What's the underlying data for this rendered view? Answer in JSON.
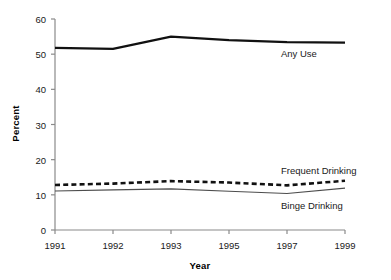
{
  "chart_data": {
    "type": "line",
    "title": "",
    "xlabel": "Year",
    "ylabel": "Percent",
    "x": [
      "1991",
      "1992",
      "1993",
      "1995",
      "1997",
      "1999"
    ],
    "categories": [
      "1991",
      "1992",
      "1993",
      "1995",
      "1997",
      "1999"
    ],
    "xtick_labels": [
      "1991",
      "1992",
      "1993",
      "1995",
      "1997",
      "1999"
    ],
    "ytick_labels": [
      "0",
      "10",
      "20",
      "30",
      "40",
      "50",
      "60"
    ],
    "ytick_values": [
      0,
      10,
      20,
      30,
      40,
      50,
      60
    ],
    "ylim": [
      0,
      60
    ],
    "grid": false,
    "legend_position": "inline-labels",
    "series": [
      {
        "name": "Any Use",
        "label": "Any Use",
        "style": "solid-thick",
        "color": "#111111",
        "values": [
          51.8,
          51.5,
          55.0,
          54.0,
          53.4,
          53.3
        ]
      },
      {
        "name": "Frequent Drinking",
        "label": "Frequent Drinking",
        "style": "dashed-thick",
        "color": "#111111",
        "values": [
          12.8,
          13.2,
          13.9,
          13.5,
          12.7,
          14.0
        ]
      },
      {
        "name": "Binge Drinking",
        "label": "Binge Drinking",
        "style": "solid-thin",
        "color": "#4d4d4d",
        "values": [
          11.1,
          11.4,
          11.7,
          11.0,
          10.4,
          11.9
        ]
      }
    ],
    "annotations": [
      {
        "text": "Any Use",
        "series": "Any Use"
      },
      {
        "text": "Frequent Drinking",
        "series": "Frequent Drinking"
      },
      {
        "text": "Binge Drinking",
        "series": "Binge Drinking"
      }
    ]
  }
}
